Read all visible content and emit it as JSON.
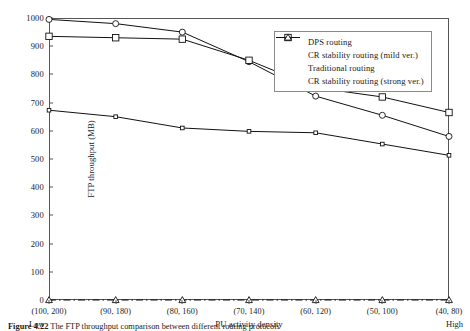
{
  "chart_data": {
    "type": "line",
    "title": "",
    "xlabel": "PU activity density",
    "ylabel": "FTP throughput (MB)",
    "categories": [
      "(100, 200)",
      "(90, 180)",
      "(80, 160)",
      "(70, 140)",
      "(60, 120)",
      "(50, 100)",
      "(40, 80)"
    ],
    "x_axis_end_labels": {
      "left": "Low",
      "right": "High"
    },
    "ylim": [
      0,
      1000
    ],
    "yticks": [
      0,
      100,
      200,
      300,
      400,
      500,
      600,
      700,
      800,
      900,
      1000
    ],
    "grid": false,
    "legend_position": "top-right",
    "series": [
      {
        "name": "DPS routing",
        "marker": "circle",
        "line": "solid",
        "values": [
          995,
          980,
          950,
          845,
          723,
          655,
          580
        ]
      },
      {
        "name": "CR stability routing (mild ver.)",
        "marker": "small-square",
        "line": "solid",
        "values": [
          673,
          650,
          610,
          598,
          593,
          553,
          513
        ]
      },
      {
        "name": "Traditional routing",
        "marker": "open-square",
        "line": "solid",
        "values": [
          935,
          930,
          925,
          850,
          753,
          720,
          665
        ]
      },
      {
        "name": "CR stability routing (strong ver.)",
        "marker": "triangle",
        "line": "dash-dot",
        "values": [
          0,
          0,
          0,
          0,
          0,
          0,
          0
        ]
      }
    ]
  },
  "caption": {
    "figure_number": "Figure 4.22",
    "text": "The FTP throughput comparison between different routing protocols"
  },
  "colors": {
    "axis": "#555555",
    "series": "#111111",
    "legend_border": "#8a8a8a"
  }
}
